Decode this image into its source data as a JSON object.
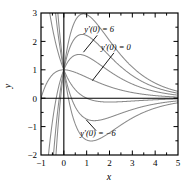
{
  "chart_data": {
    "type": "line",
    "title": "",
    "xlabel": "x",
    "ylabel": "y",
    "xlim": [
      -1,
      5
    ],
    "ylim": [
      -2,
      3
    ],
    "xticks": [
      "-1",
      "0",
      "1",
      "2",
      "3",
      "4",
      "5"
    ],
    "xtick_values": [
      -1,
      0,
      1,
      2,
      3,
      4,
      5
    ],
    "yticks": [
      "3",
      "2",
      "1",
      "0",
      "-1",
      "-2"
    ],
    "ytick_values": [
      3,
      2,
      1,
      0,
      -1,
      -2
    ],
    "minor_tick_step": 0.5,
    "grid": false,
    "legend": "none",
    "line_color": "#808080",
    "axis_color": "#000000",
    "common_initial_value": "y(0) = 1",
    "annotations": [
      {
        "name": "upper",
        "label": "y'(0) = 6",
        "x": 1.55,
        "y": 2.32,
        "leader_to_x": 0.86,
        "leader_to_y": 1.62
      },
      {
        "name": "middle",
        "label": "y'(0) = 0",
        "x": 2.28,
        "y": 1.7,
        "leader_to_x": 1.25,
        "leader_to_y": 0.62
      },
      {
        "name": "lower",
        "label": "y'(0) = -6",
        "x": 1.5,
        "y": -1.32,
        "leader_to_x": 0.98,
        "leader_to_y": -0.76
      }
    ],
    "series": [
      {
        "name": "y'(0) = 6",
        "slope": 6,
        "peak_x": 0.52,
        "peak_y": 2.38
      },
      {
        "name": "y'(0) = 4",
        "slope": 4,
        "peak_x": 0.58,
        "peak_y": 1.92
      },
      {
        "name": "y'(0) = 2",
        "slope": 2,
        "peak_x": 0.62,
        "peak_y": 1.5
      },
      {
        "name": "y'(0) = 0",
        "slope": 0,
        "peak_x": 0.0,
        "peak_y": 1.0
      },
      {
        "name": "y'(0) = -2",
        "slope": -2,
        "peak_x": 0.7,
        "peak_y": 0.42
      },
      {
        "name": "y'(0) = -4",
        "slope": -4,
        "peak_x": 0.8,
        "peak_y": -0.33
      },
      {
        "name": "y'(0) = -6",
        "slope": -6,
        "peak_x": 0.88,
        "peak_y": -0.72
      }
    ]
  }
}
